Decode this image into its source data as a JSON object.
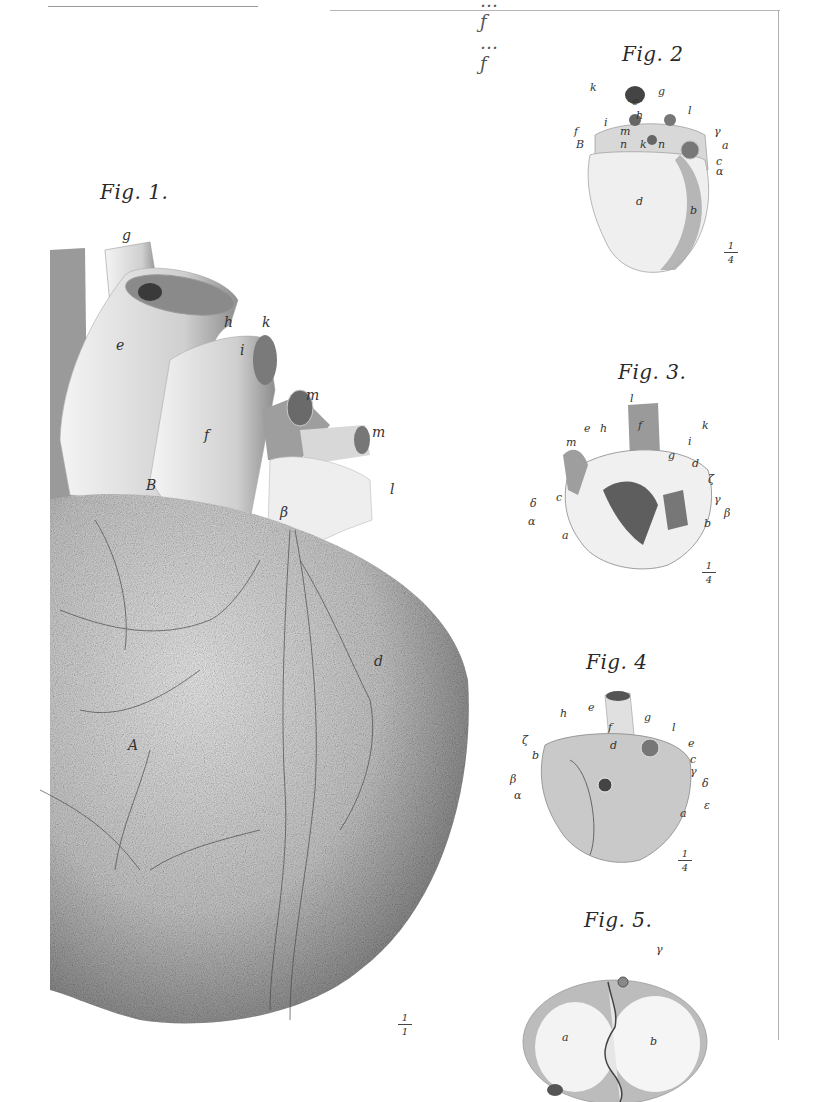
{
  "plate": {
    "header_script": "…ƒ … ƒ",
    "figures": [
      {
        "id": "fig1",
        "title": "Fig. 1.",
        "labels": [
          "g",
          "e",
          "h",
          "k",
          "i",
          "f",
          "m",
          "m",
          "l",
          "β",
          "B",
          "d",
          "A"
        ],
        "scale": {
          "num": "1",
          "den": "1"
        }
      },
      {
        "id": "fig2",
        "title": "Fig. 2",
        "labels": [
          "k",
          "g",
          "e",
          "h",
          "l",
          "i",
          "f",
          "B",
          "m",
          "n",
          "k",
          "n",
          "γ",
          "a",
          "c",
          "α",
          "d",
          "b"
        ],
        "scale": {
          "num": "1",
          "den": "4"
        }
      },
      {
        "id": "fig3",
        "title": "Fig. 3.",
        "labels": [
          "l",
          "f",
          "k",
          "e",
          "h",
          "m",
          "i",
          "g",
          "d",
          "ζ",
          "c",
          "δ",
          "γ",
          "β",
          "α",
          "b",
          "a"
        ],
        "scale": {
          "num": "1",
          "den": "4"
        }
      },
      {
        "id": "fig4",
        "title": "Fig. 4",
        "labels": [
          "h",
          "e",
          "g",
          "f",
          "l",
          "d",
          "ζ",
          "b",
          "e",
          "c",
          "β",
          "γ",
          "δ",
          "α",
          "a",
          "ε"
        ],
        "scale": {
          "num": "1",
          "den": "4"
        }
      },
      {
        "id": "fig5",
        "title": "Fig. 5.",
        "labels": [
          "γ",
          "a",
          "b"
        ]
      }
    ]
  }
}
